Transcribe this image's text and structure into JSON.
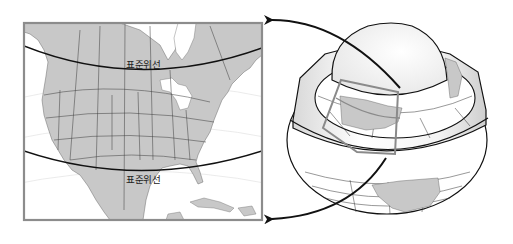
{
  "diagram": {
    "map_panel": {
      "region": "North America",
      "standard_parallel_label_top": "표준위선",
      "standard_parallel_label_bottom": "표준위선"
    },
    "globe_panel": {
      "description": "Globe intersected by a cone along two standard parallels; projected area outlined"
    },
    "colors": {
      "land": "#c8c8c8",
      "water": "#ffffff",
      "frame": "#8c8c8c",
      "parallel_line": "#111111",
      "grid": "#e2e2e2",
      "globe_outline": "#111111",
      "projection_box": "#8a8a8a"
    }
  }
}
